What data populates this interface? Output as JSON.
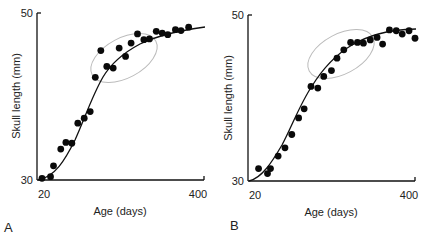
{
  "chart_data": [
    {
      "type": "scatter",
      "panel_label": "A",
      "title": "",
      "xlabel": "Age (days)",
      "ylabel": "Skull length (mm)",
      "x_ticks": [
        "20",
        "400"
      ],
      "y_ticks": [
        "30",
        "50"
      ],
      "xlim": [
        20,
        400
      ],
      "ylim": [
        30,
        50
      ],
      "grid": false,
      "fit": "sigmoid curve",
      "annotation": "ellipse highlighting scattered mid-growth points",
      "points": [
        {
          "x": 20,
          "y": 30.2
        },
        {
          "x": 40,
          "y": 30.4
        },
        {
          "x": 47,
          "y": 31.7
        },
        {
          "x": 64,
          "y": 33.7
        },
        {
          "x": 76,
          "y": 34.5
        },
        {
          "x": 90,
          "y": 34.4
        },
        {
          "x": 104,
          "y": 36.8
        },
        {
          "x": 119,
          "y": 37.4
        },
        {
          "x": 133,
          "y": 38.2
        },
        {
          "x": 145,
          "y": 42.3
        },
        {
          "x": 158,
          "y": 45.5
        },
        {
          "x": 172,
          "y": 43.6
        },
        {
          "x": 187,
          "y": 43.4
        },
        {
          "x": 201,
          "y": 45.8
        },
        {
          "x": 216,
          "y": 44.8
        },
        {
          "x": 229,
          "y": 46.4
        },
        {
          "x": 244,
          "y": 47.5
        },
        {
          "x": 259,
          "y": 46.8
        },
        {
          "x": 272,
          "y": 46.9
        },
        {
          "x": 288,
          "y": 47.8
        },
        {
          "x": 302,
          "y": 47.6
        },
        {
          "x": 315,
          "y": 47.4
        },
        {
          "x": 333,
          "y": 48.0
        },
        {
          "x": 346,
          "y": 47.9
        },
        {
          "x": 364,
          "y": 48.3
        }
      ]
    },
    {
      "type": "scatter",
      "panel_label": "B",
      "title": "",
      "xlabel": "Age (days)",
      "ylabel": "Skull length (mm)",
      "x_ticks": [
        "20",
        "400"
      ],
      "y_ticks": [
        "30",
        "50"
      ],
      "xlim": [
        20,
        400
      ],
      "ylim": [
        30,
        50
      ],
      "grid": false,
      "fit": "sigmoid curve",
      "annotation": "ellipse highlighting tightly fitting mid-growth points",
      "points": [
        {
          "x": 33,
          "y": 31.5
        },
        {
          "x": 54,
          "y": 30.9
        },
        {
          "x": 61,
          "y": 31.5
        },
        {
          "x": 79,
          "y": 33.0
        },
        {
          "x": 95,
          "y": 34.0
        },
        {
          "x": 111,
          "y": 35.6
        },
        {
          "x": 127,
          "y": 37.6
        },
        {
          "x": 140,
          "y": 38.7
        },
        {
          "x": 156,
          "y": 41.4
        },
        {
          "x": 172,
          "y": 41.2
        },
        {
          "x": 186,
          "y": 42.6
        },
        {
          "x": 204,
          "y": 43.3
        },
        {
          "x": 217,
          "y": 44.8
        },
        {
          "x": 233,
          "y": 45.8
        },
        {
          "x": 249,
          "y": 46.7
        },
        {
          "x": 265,
          "y": 46.7
        },
        {
          "x": 279,
          "y": 46.6
        },
        {
          "x": 295,
          "y": 47.0
        },
        {
          "x": 311,
          "y": 47.3
        },
        {
          "x": 324,
          "y": 46.5
        },
        {
          "x": 340,
          "y": 48.2
        },
        {
          "x": 356,
          "y": 48.1
        },
        {
          "x": 370,
          "y": 47.7
        },
        {
          "x": 386,
          "y": 48.1
        },
        {
          "x": 400,
          "y": 47.2
        }
      ]
    }
  ]
}
